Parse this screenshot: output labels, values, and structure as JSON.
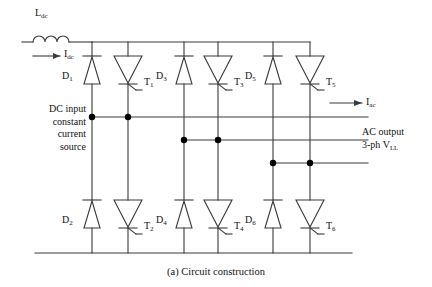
{
  "figure": {
    "caption": "(a) Circuit construction",
    "type": "three-phase current source inverter circuit schematic"
  },
  "labels": {
    "inductor": "L",
    "inductor_sub": "dc",
    "dc_current": "I",
    "dc_current_sub": "dc",
    "ac_current": "I",
    "ac_current_sub": "ac",
    "dc_input_line1": "DC input",
    "dc_input_line2": "constant",
    "dc_input_line3": "current",
    "dc_input_line4": "source",
    "ac_output_line1": "AC output",
    "ac_output_line2a": "3-ph V",
    "ac_output_line2b": "LL"
  },
  "devices": {
    "top": [
      {
        "name": "D",
        "sub": "1",
        "kind": "diode",
        "col": 1
      },
      {
        "name": "T",
        "sub": "1",
        "kind": "thyristor",
        "col": 2
      },
      {
        "name": "D",
        "sub": "3",
        "kind": "diode",
        "col": 3
      },
      {
        "name": "T",
        "sub": "3",
        "kind": "thyristor",
        "col": 4
      },
      {
        "name": "D",
        "sub": "5",
        "kind": "diode",
        "col": 5
      },
      {
        "name": "T",
        "sub": "5",
        "kind": "thyristor",
        "col": 6
      }
    ],
    "bottom": [
      {
        "name": "D",
        "sub": "2",
        "kind": "diode",
        "col": 1
      },
      {
        "name": "T",
        "sub": "2",
        "kind": "thyristor",
        "col": 2
      },
      {
        "name": "D",
        "sub": "4",
        "kind": "diode",
        "col": 3
      },
      {
        "name": "T",
        "sub": "4",
        "kind": "thyristor",
        "col": 4
      },
      {
        "name": "D",
        "sub": "6",
        "kind": "diode",
        "col": 5
      },
      {
        "name": "T",
        "sub": "6",
        "kind": "thyristor",
        "col": 6
      }
    ]
  },
  "colors": {
    "wire": "#3a3a3a",
    "node": "#000000",
    "text": "#111111",
    "background": "#ffffff"
  },
  "geometry": {
    "columns_x": [
      92,
      128,
      184,
      218,
      273,
      310
    ],
    "top_rail_y": 42,
    "bottom_rail_y": 253,
    "ac_lines_y": [
      117,
      140,
      163
    ]
  }
}
